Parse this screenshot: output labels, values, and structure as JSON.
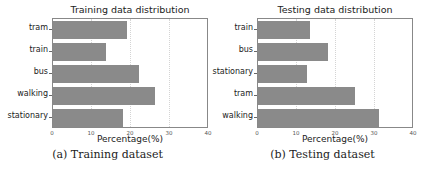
{
  "chart_data": [
    {
      "type": "bar",
      "orientation": "horizontal",
      "title": "Training data distribution",
      "categories": [
        "tram",
        "train",
        "bus",
        "walking",
        "stationary"
      ],
      "values": [
        19.0,
        13.6,
        22.1,
        26.2,
        18.0
      ],
      "xlabel": "Percentage(%)",
      "ylabel": "",
      "xlim": [
        0,
        40
      ],
      "xticks": [
        "0",
        "10",
        "20",
        "30",
        "40"
      ],
      "grid": "vertical dotted",
      "bar_color": "#8a8a8a",
      "caption": "(a) Training dataset"
    },
    {
      "type": "bar",
      "orientation": "horizontal",
      "title": "Testing data distribution",
      "categories": [
        "train",
        "bus",
        "stationary",
        "tram",
        "walking"
      ],
      "values": [
        13.3,
        17.9,
        12.5,
        24.9,
        31.0
      ],
      "xlabel": "Percentage(%)",
      "ylabel": "",
      "xlim": [
        0,
        40
      ],
      "xticks": [
        "0",
        "10",
        "20",
        "30",
        "40"
      ],
      "grid": "vertical dotted",
      "bar_color": "#8a8a8a",
      "caption": "(b) Testing dataset"
    }
  ]
}
